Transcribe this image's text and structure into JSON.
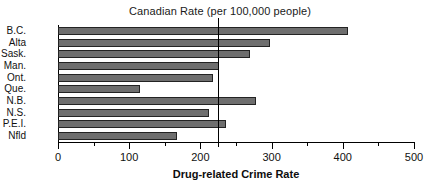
{
  "chart_data": {
    "type": "bar",
    "orientation": "horizontal",
    "title": "Canadian Rate (per 100,000 people)",
    "xlabel": "Drug-related Crime Rate",
    "ylabel": "",
    "xlim": [
      0,
      500
    ],
    "grid": false,
    "legend": null,
    "categories": [
      "B.C.",
      "Alta",
      "Sask.",
      "Man.",
      "Ont.",
      "Que.",
      "N.B.",
      "N.S.",
      "P.E.I.",
      "Nfld"
    ],
    "values": [
      407,
      298,
      270,
      226,
      218,
      115,
      278,
      212,
      236,
      167
    ],
    "xticks": [
      0,
      100,
      200,
      300,
      400,
      500
    ],
    "xtick_labels": [
      "0",
      "100",
      "200",
      "300",
      "400",
      "500"
    ],
    "xminor_ticks": [
      50,
      150,
      250,
      350,
      450
    ],
    "annotations": [
      {
        "type": "vertical-reference-line",
        "name": "canadian-rate-reference-line",
        "value": 225,
        "label": "Canadian Rate (per 100,000 people)"
      }
    ],
    "bar_color": "#6e6e6e",
    "bar_edge_color": "#232323",
    "axis_color": "#000000",
    "background_color": "#ffffff"
  }
}
